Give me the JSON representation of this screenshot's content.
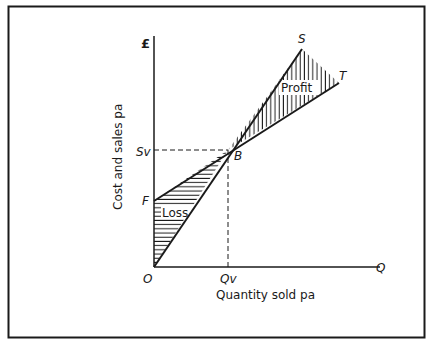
{
  "diagram": {
    "y_axis": {
      "label": "Cost and sales pa",
      "unit_symbol": "£"
    },
    "x_axis": {
      "label": "Quantity sold pa",
      "end_label": "Q"
    },
    "points": {
      "origin": "O",
      "fixed_cost": "F",
      "break_even": "B",
      "sales_line_end": "S",
      "total_cost_line_end": "T",
      "break_even_sales": "Sv",
      "break_even_quantity": "Qv"
    },
    "regions": {
      "loss": "Loss",
      "profit": "Profit"
    },
    "lines": [
      {
        "name": "sales",
        "from": "O",
        "to": "S"
      },
      {
        "name": "total-cost",
        "from": "F",
        "to": "T"
      }
    ],
    "colors": {
      "ink": "#1a1a1a",
      "background": "#ffffff"
    }
  }
}
